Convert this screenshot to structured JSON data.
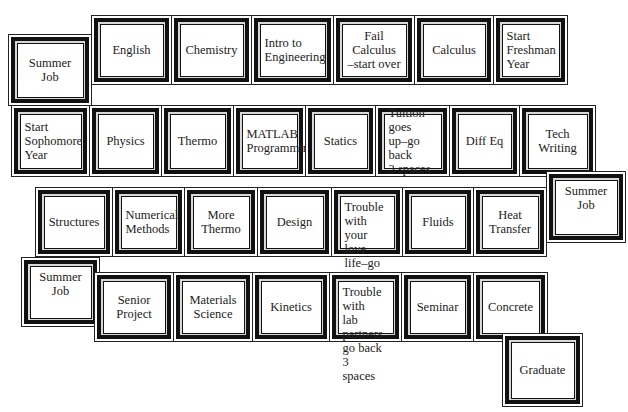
{
  "board": {
    "title": "Engineering curriculum board game",
    "squares": [
      {
        "id": "summer-job-1",
        "label": "Summer Job",
        "x": 8,
        "y": 34,
        "w": 84,
        "h": 72
      },
      {
        "id": "english",
        "label": "English",
        "x": 91,
        "y": 15,
        "w": 81,
        "h": 70
      },
      {
        "id": "chemistry",
        "label": "Chemistry",
        "x": 171,
        "y": 15,
        "w": 81,
        "h": 70
      },
      {
        "id": "intro-to-engineering",
        "label": "Intro to\nEngineering",
        "x": 251,
        "y": 15,
        "w": 83,
        "h": 70,
        "align": "left"
      },
      {
        "id": "fail-calculus",
        "label": "Fail Calculus\n–start over",
        "x": 333,
        "y": 15,
        "w": 82,
        "h": 70
      },
      {
        "id": "calculus",
        "label": "Calculus",
        "x": 414,
        "y": 15,
        "w": 80,
        "h": 70
      },
      {
        "id": "start-freshman-year",
        "label": "Start\nFreshman\nYear",
        "x": 493,
        "y": 15,
        "w": 75,
        "h": 70,
        "align": "left"
      },
      {
        "id": "start-sophomore-year",
        "label": "Start\nSophomore\nYear",
        "x": 11,
        "y": 105,
        "w": 79,
        "h": 72,
        "align": "left"
      },
      {
        "id": "physics",
        "label": "Physics",
        "x": 89,
        "y": 105,
        "w": 73,
        "h": 72
      },
      {
        "id": "thermo",
        "label": "Thermo",
        "x": 161,
        "y": 105,
        "w": 73,
        "h": 72
      },
      {
        "id": "matlab-programming",
        "label": "MATLAB\nProgramming",
        "x": 233,
        "y": 105,
        "w": 73,
        "h": 72,
        "align": "left"
      },
      {
        "id": "statics",
        "label": "Statics",
        "x": 305,
        "y": 105,
        "w": 71,
        "h": 72
      },
      {
        "id": "tuition-goes-up",
        "label": "Tuition goes\nup–go back\n3 spaces",
        "x": 375,
        "y": 105,
        "w": 75,
        "h": 72,
        "align": "left"
      },
      {
        "id": "diff-eq",
        "label": "Diff Eq",
        "x": 449,
        "y": 105,
        "w": 71,
        "h": 72
      },
      {
        "id": "tech-writing",
        "label": "Tech\nWriting",
        "x": 519,
        "y": 105,
        "w": 77,
        "h": 72
      },
      {
        "id": "structures",
        "label": "Structures",
        "x": 35,
        "y": 187,
        "w": 78,
        "h": 70
      },
      {
        "id": "numerical-methods",
        "label": "Numerical\nMethods",
        "x": 112,
        "y": 187,
        "w": 73,
        "h": 70,
        "align": "left"
      },
      {
        "id": "more-thermo",
        "label": "More\nThermo",
        "x": 184,
        "y": 187,
        "w": 74,
        "h": 70
      },
      {
        "id": "design",
        "label": "Design",
        "x": 257,
        "y": 187,
        "w": 75,
        "h": 70
      },
      {
        "id": "trouble-love-life",
        "label": "Trouble with\nyour love\nlife–go back\n2 spaces",
        "x": 331,
        "y": 187,
        "w": 72,
        "h": 70,
        "align": "left",
        "valign": "top"
      },
      {
        "id": "fluids",
        "label": "Fluids",
        "x": 402,
        "y": 187,
        "w": 72,
        "h": 70
      },
      {
        "id": "heat-transfer",
        "label": "Heat\nTransfer",
        "x": 473,
        "y": 187,
        "w": 74,
        "h": 70
      },
      {
        "id": "summer-job-2",
        "label": "Summer Job",
        "x": 546,
        "y": 171,
        "w": 80,
        "h": 72,
        "valign": "top"
      },
      {
        "id": "summer-job-3",
        "label": "Summer Job",
        "x": 21,
        "y": 257,
        "w": 79,
        "h": 70,
        "valign": "top"
      },
      {
        "id": "senior-project",
        "label": "Senior\nProject",
        "x": 94,
        "y": 272,
        "w": 80,
        "h": 70
      },
      {
        "id": "materials-science",
        "label": "Materials\nScience",
        "x": 173,
        "y": 272,
        "w": 80,
        "h": 70
      },
      {
        "id": "kinetics",
        "label": "Kinetics",
        "x": 252,
        "y": 272,
        "w": 78,
        "h": 70
      },
      {
        "id": "trouble-lab-partners",
        "label": "Trouble with\nlab partners–\ngo back 3\nspaces",
        "x": 329,
        "y": 272,
        "w": 73,
        "h": 70,
        "align": "left",
        "valign": "top"
      },
      {
        "id": "seminar",
        "label": "Seminar",
        "x": 401,
        "y": 272,
        "w": 73,
        "h": 70
      },
      {
        "id": "concrete",
        "label": "Concrete",
        "x": 473,
        "y": 272,
        "w": 75,
        "h": 70
      },
      {
        "id": "graduate",
        "label": "Graduate",
        "x": 502,
        "y": 333,
        "w": 81,
        "h": 74
      }
    ]
  }
}
